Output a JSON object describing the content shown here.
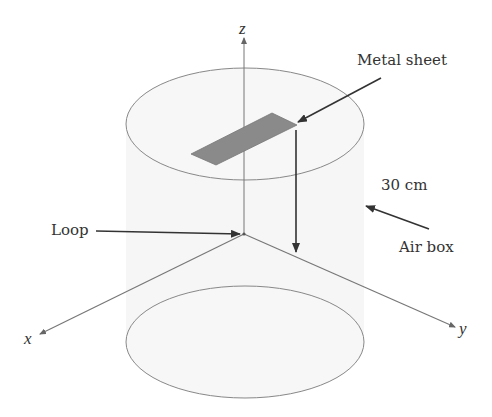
{
  "diagram": {
    "axes": {
      "x_label": "x",
      "y_label": "y",
      "z_label": "z"
    },
    "labels": {
      "metal_sheet": "Metal sheet",
      "dimension": "30 cm",
      "air_box": "Air box",
      "loop": "Loop"
    },
    "colors": {
      "line": "#777777",
      "arrow": "#333333",
      "sheet_fill": "#8a8a8a",
      "cylinder_fill": "#f5f5f5",
      "text": "#333333"
    }
  }
}
